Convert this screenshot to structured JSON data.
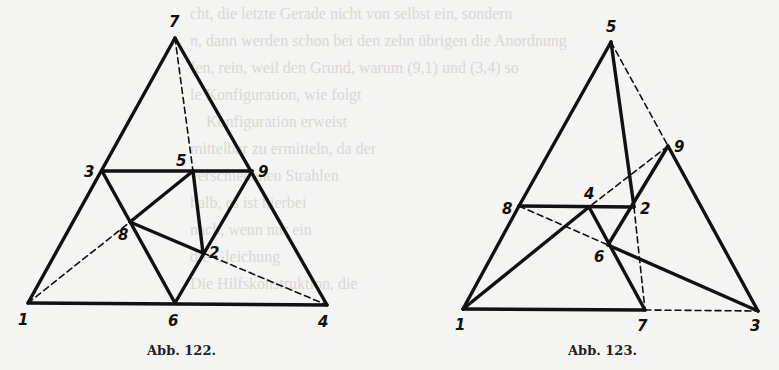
{
  "background_text": [
    "cht, die letzte Gerade nicht von selbst ein, sondern",
    "n, dann werden schon bei den zehn übrigen die Anordnung",
    "fen, rein, weil den Grund, warum (9,1) und (3,4) so",
    "le Konfiguration, wie folgt",
    "    Konfiguration erweist",
    "mittelbar zu ermitteln, da der",
    "verschiedenen Strahlen",
    "halb, es ist hierbei",
    "nach, wenn nur ein",
    "die Gleichung",
    "Die Hilfskonstruktion, die"
  ],
  "figures": [
    {
      "id": "abb-122",
      "caption": "Abb. 122.",
      "points": {
        "7": [
          175,
          38
        ],
        "3": [
          102,
          171
        ],
        "5": [
          193,
          171
        ],
        "9": [
          252,
          171
        ],
        "8": [
          130,
          222
        ],
        "2": [
          203,
          253
        ],
        "1": [
          28,
          303
        ],
        "6": [
          175,
          303
        ],
        "4": [
          327,
          305
        ]
      },
      "labels": [
        {
          "text": "7",
          "x": 169,
          "y": 27
        },
        {
          "text": "3",
          "x": 84,
          "y": 177
        },
        {
          "text": "5",
          "x": 176,
          "y": 166
        },
        {
          "text": "9",
          "x": 258,
          "y": 177
        },
        {
          "text": "8",
          "x": 118,
          "y": 240
        },
        {
          "text": "2",
          "x": 209,
          "y": 258
        },
        {
          "text": "1",
          "x": 18,
          "y": 325
        },
        {
          "text": "6",
          "x": 168,
          "y": 326
        },
        {
          "text": "4",
          "x": 318,
          "y": 327
        }
      ],
      "solid": [
        [
          "7",
          "1"
        ],
        [
          "7",
          "4"
        ],
        [
          "1",
          "4"
        ],
        [
          "3",
          "9"
        ],
        [
          "3",
          "6"
        ],
        [
          "9",
          "6"
        ],
        [
          "8",
          "5"
        ],
        [
          "5",
          "2"
        ],
        [
          "8",
          "2"
        ]
      ],
      "dashed": [
        [
          "7",
          "5"
        ],
        [
          "1",
          "8"
        ],
        [
          "2",
          "4"
        ]
      ]
    },
    {
      "id": "abb-123",
      "caption": "Abb. 123.",
      "points": {
        "5": [
          611,
          42
        ],
        "9": [
          668,
          146
        ],
        "8": [
          519,
          206
        ],
        "4": [
          589,
          207
        ],
        "2": [
          634,
          207
        ],
        "6": [
          608,
          245
        ],
        "1": [
          463,
          309
        ],
        "7": [
          645,
          310
        ],
        "3": [
          758,
          311
        ]
      },
      "labels": [
        {
          "text": "5",
          "x": 606,
          "y": 32
        },
        {
          "text": "9",
          "x": 674,
          "y": 152
        },
        {
          "text": "8",
          "x": 502,
          "y": 214
        },
        {
          "text": "4",
          "x": 584,
          "y": 199
        },
        {
          "text": "2",
          "x": 640,
          "y": 214
        },
        {
          "text": "6",
          "x": 594,
          "y": 262
        },
        {
          "text": "1",
          "x": 455,
          "y": 330
        },
        {
          "text": "7",
          "x": 637,
          "y": 331
        },
        {
          "text": "3",
          "x": 750,
          "y": 331
        }
      ],
      "solid": [
        [
          "5",
          "8"
        ],
        [
          "8",
          "1"
        ],
        [
          "5",
          "2"
        ],
        [
          "9",
          "3"
        ],
        [
          "1",
          "7"
        ],
        [
          "8",
          "2"
        ],
        [
          "1",
          "4"
        ],
        [
          "4",
          "7"
        ],
        [
          "9",
          "6"
        ],
        [
          "6",
          "3"
        ]
      ],
      "dashed": [
        [
          "5",
          "9"
        ],
        [
          "9",
          "4"
        ],
        [
          "8",
          "6"
        ],
        [
          "2",
          "7"
        ],
        [
          "7",
          "3"
        ]
      ]
    }
  ],
  "captions": {
    "left": "Abb. 122.",
    "right": "Abb. 123."
  }
}
